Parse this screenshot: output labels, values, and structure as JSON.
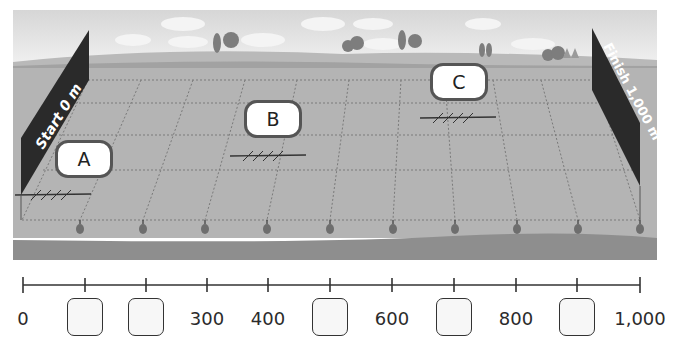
{
  "scene": {
    "start_flag": "Start 0 m",
    "finish_flag": "Finish 1,000 m",
    "boat_labels": [
      {
        "id": "A",
        "label": "A"
      },
      {
        "id": "B",
        "label": "B"
      },
      {
        "id": "C",
        "label": "C"
      }
    ],
    "colors": {
      "sky_top": "#d8d8d8",
      "sky_bottom": "#f2f2f2",
      "hill": "#a9a9a9",
      "field": "#b4b4b4",
      "bank": "#8c8c8c",
      "flag": "#2a2a2a",
      "buoy": "#6e6e6e"
    }
  },
  "number_line": {
    "min": 0,
    "max": 1000,
    "interval": 100,
    "items": [
      {
        "value": "0",
        "type": "label"
      },
      {
        "value": "",
        "type": "blank"
      },
      {
        "value": "",
        "type": "blank"
      },
      {
        "value": "300",
        "type": "label"
      },
      {
        "value": "400",
        "type": "label"
      },
      {
        "value": "",
        "type": "blank"
      },
      {
        "value": "600",
        "type": "label"
      },
      {
        "value": "",
        "type": "blank"
      },
      {
        "value": "800",
        "type": "label"
      },
      {
        "value": "",
        "type": "blank"
      },
      {
        "value": "1,000",
        "type": "label"
      }
    ]
  }
}
